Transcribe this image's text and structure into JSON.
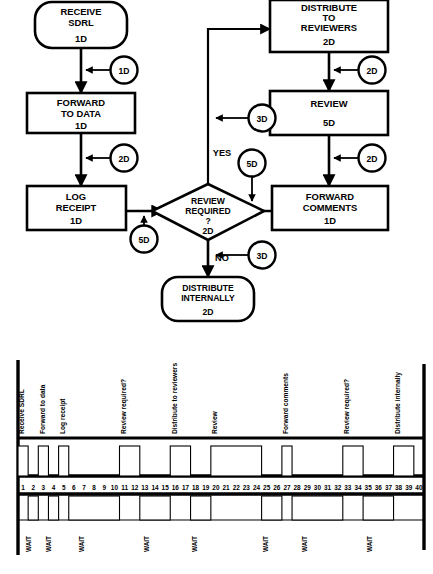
{
  "flowchart": {
    "nodes": [
      {
        "id": "receive",
        "shape": "terminator",
        "lines": [
          "RECEIVE",
          "SDRL"
        ],
        "duration": "1D"
      },
      {
        "id": "forward_data",
        "shape": "process",
        "lines": [
          "FORWARD",
          "TO DATA"
        ],
        "duration": "1D"
      },
      {
        "id": "log_receipt",
        "shape": "process",
        "lines": [
          "LOG",
          "RECEIPT"
        ],
        "duration": "1D"
      },
      {
        "id": "review_required",
        "shape": "decision",
        "lines": [
          "REVIEW",
          "REQUIRED",
          "?"
        ],
        "duration": "2D"
      },
      {
        "id": "distribute_reviewers",
        "shape": "process",
        "lines": [
          "DISTRIBUTE",
          "TO",
          "REVIEWERS"
        ],
        "duration": "2D"
      },
      {
        "id": "review",
        "shape": "process",
        "lines": [
          "REVIEW"
        ],
        "duration": "5D"
      },
      {
        "id": "forward_comments",
        "shape": "process",
        "lines": [
          "FORWARD",
          "COMMENTS"
        ],
        "duration": "1D"
      },
      {
        "id": "distribute_internally",
        "shape": "terminator",
        "lines": [
          "DISTRIBUTE",
          "INTERNALLY"
        ],
        "duration": "2D"
      }
    ],
    "lag_bubbles": [
      {
        "id": "lag-receive-forward",
        "label": "1D"
      },
      {
        "id": "lag-forward-log",
        "label": "2D"
      },
      {
        "id": "lag-log-decision",
        "label": "5D"
      },
      {
        "id": "lag-decision-distribute",
        "label": "3D"
      },
      {
        "id": "lag-distribute-review",
        "label": "2D"
      },
      {
        "id": "lag-review-comments",
        "label": "2D"
      },
      {
        "id": "lag-comments-decision",
        "label": "5D"
      },
      {
        "id": "lag-decision-internal",
        "label": "3D"
      }
    ],
    "branch_labels": {
      "yes": "YES",
      "no": "NO"
    }
  },
  "gantt": {
    "axis_numbers": [
      1,
      2,
      3,
      4,
      5,
      6,
      7,
      8,
      9,
      10,
      11,
      12,
      13,
      14,
      15,
      16,
      17,
      18,
      19,
      20,
      21,
      22,
      23,
      24,
      25,
      26,
      27,
      28,
      29,
      30,
      31,
      32,
      33,
      34,
      35,
      36,
      37,
      38,
      39,
      40
    ],
    "axis_min": 1,
    "axis_max": 40,
    "activities": [
      {
        "label": "Receive SDRL",
        "start": 1,
        "end": 1
      },
      {
        "label": "Forward to data",
        "start": 3,
        "end": 3
      },
      {
        "label": "Log receipt",
        "start": 5,
        "end": 5
      },
      {
        "label": "Review required?",
        "start": 11,
        "end": 12
      },
      {
        "label": "Distribute to reviewers",
        "start": 16,
        "end": 17
      },
      {
        "label": "Review",
        "start": 20,
        "end": 24
      },
      {
        "label": "Forward comments",
        "start": 27,
        "end": 27
      },
      {
        "label": "Review required?",
        "start": 33,
        "end": 34
      },
      {
        "label": "Distribute internally",
        "start": 38,
        "end": 39
      }
    ],
    "waits": [
      {
        "label": "WAIT",
        "start": 2,
        "end": 2
      },
      {
        "label": "WAIT",
        "start": 4,
        "end": 4
      },
      {
        "label": "WAIT",
        "start": 6,
        "end": 10
      },
      {
        "label": "WAIT",
        "start": 13,
        "end": 15
      },
      {
        "label": "WAIT",
        "start": 18,
        "end": 19
      },
      {
        "label": "WAIT",
        "start": 25,
        "end": 26
      },
      {
        "label": "WAIT",
        "start": 28,
        "end": 32
      },
      {
        "label": "WAIT",
        "start": 35,
        "end": 37
      }
    ]
  },
  "colors": {
    "stroke": "#000000",
    "fill": "#ffffff",
    "background": "#ffffff"
  }
}
